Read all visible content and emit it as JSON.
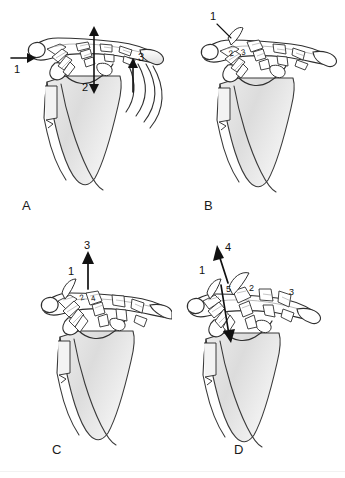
{
  "figure": {
    "type": "anatomical-illustration",
    "view": "anterior right shoulder, scapula clavicle and ribs",
    "background_color": "#ffffff",
    "ink_color": "#1a1a1a",
    "bone_fill": "#ffffff",
    "shade_light": "#e9e9e9",
    "shade_mid": "#dadada",
    "shade_dark": "#c6c6c6"
  },
  "panels": [
    {
      "id": "a",
      "letter": "A",
      "callouts": [
        {
          "label": "1",
          "kind": "arrow-right",
          "note": "horizontal arrow at distal clavicle"
        },
        {
          "label": "2",
          "kind": "arrow-double-vertical",
          "note": "double headed vertical arrow at coracoclavicular interval"
        },
        {
          "label": "3",
          "kind": "arrow-up",
          "note": "upward arrow lateral to scapula"
        }
      ],
      "features": [
        "clavicle",
        "acromion",
        "coracoid",
        "glenoid",
        "scapula body",
        "ribs"
      ],
      "rib_count": 4
    },
    {
      "id": "b",
      "letter": "B",
      "callouts": [
        {
          "label": "1",
          "kind": "leader",
          "note": "leader line to superior acromioclavicular region"
        },
        {
          "label": "2",
          "kind": "inline",
          "note": "ligament bundle"
        },
        {
          "label": "3",
          "kind": "inline",
          "note": "ligament bundle"
        }
      ],
      "features": [
        "clavicle",
        "acromion",
        "coracoid",
        "glenoid",
        "scapula body"
      ],
      "rib_count": 0
    },
    {
      "id": "c",
      "letter": "C",
      "callouts": [
        {
          "label": "3",
          "kind": "arrow-up",
          "note": "upward arrow above acromioclavicular joint"
        },
        {
          "label": "1",
          "kind": "plain",
          "note": "disrupted superior structure"
        },
        {
          "label": "2",
          "kind": "inline",
          "note": "ligament bundle"
        },
        {
          "label": "4",
          "kind": "inline",
          "note": "ligament bundle"
        }
      ],
      "features": [
        "clavicle",
        "acromion",
        "coracoid",
        "glenoid",
        "scapula body"
      ],
      "rib_count": 0
    },
    {
      "id": "d",
      "letter": "D",
      "callouts": [
        {
          "label": "4",
          "kind": "arrow-up-left",
          "note": "oblique arrow of displacement"
        },
        {
          "label": "1",
          "kind": "plain",
          "note": "disrupted superior structure"
        },
        {
          "label": "5",
          "kind": "inline",
          "note": "ligament bundle"
        },
        {
          "label": "2",
          "kind": "inline",
          "note": "ligament bundle"
        },
        {
          "label": "3",
          "kind": "inline",
          "note": "ligament bundle"
        }
      ],
      "features": [
        "clavicle",
        "acromion",
        "coracoid",
        "glenoid",
        "scapula body"
      ],
      "rib_count": 0
    }
  ]
}
